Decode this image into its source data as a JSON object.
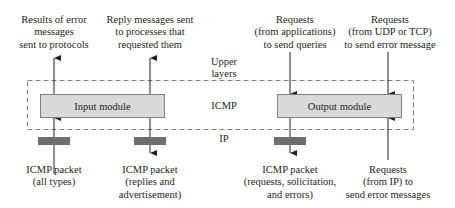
{
  "diagram": {
    "layers": {
      "upper": "Upper layers",
      "upper_line1": "Upper",
      "upper_line2": "layers",
      "icmp": "ICMP",
      "ip": "IP"
    },
    "modules": {
      "input": "Input module",
      "output": "Output module"
    },
    "top_labels": {
      "results": [
        "Results of error",
        "messages",
        "sent to protocols"
      ],
      "replies": [
        "Reply messages sent",
        "to processes that",
        "requested them"
      ],
      "app_requests": [
        "Requests",
        "(from applications)",
        "to send queries"
      ],
      "udp_tcp_requests": [
        "Requests",
        "(from UDP or TCP)",
        "to send error message"
      ]
    },
    "bottom_labels": {
      "in_packet": [
        "ICMP  packet",
        "(all types)"
      ],
      "out_replies": [
        "ICMP  packet",
        "(replies and",
        "advertisement)"
      ],
      "out_requests": [
        "ICMP  packet",
        "(requests, solicitation,",
        "and errors)"
      ],
      "ip_requests": [
        "Requests",
        "(from IP) to",
        "send error messages"
      ]
    },
    "colors": {
      "module_fill": "#d9d9d9",
      "ip_bar": "#6d6e71",
      "line": "#231f20",
      "dash": "#7f7f7f"
    }
  }
}
